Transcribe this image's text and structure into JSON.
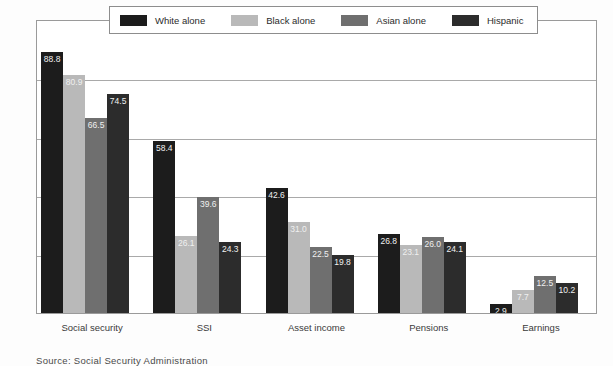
{
  "chart_data": {
    "type": "bar",
    "title": "",
    "subtitle": "",
    "xlabel": "",
    "ylabel": "Percent",
    "ylim": [
      0,
      100
    ],
    "grid": true,
    "gridlines": [
      20,
      40,
      60,
      80
    ],
    "legend_position": "top-center",
    "categories": [
      "Social security",
      "SSI",
      "Asset income",
      "Pensions",
      "Earnings"
    ],
    "series": [
      {
        "name": "White alone",
        "color": "#1c1c1c",
        "values": [
          88.8,
          58.4,
          42.6,
          26.8,
          2.9
        ],
        "labels": [
          "88.8",
          "58.4",
          "42.6",
          "26.8",
          "2.9"
        ]
      },
      {
        "name": "Black alone",
        "color": "#b9b9b9",
        "values": [
          80.9,
          26.1,
          31.0,
          23.1,
          7.7
        ],
        "labels": [
          "80.9",
          "26.1",
          "31.0",
          "23.1",
          "7.7"
        ]
      },
      {
        "name": "Asian alone",
        "color": "#6f6f6f",
        "values": [
          66.5,
          39.6,
          22.5,
          26.0,
          12.5
        ],
        "labels": [
          "66.5",
          "39.6",
          "22.5",
          "26.0",
          "12.5"
        ]
      },
      {
        "name": "Hispanic",
        "color": "#2c2c2c",
        "values": [
          74.5,
          24.3,
          19.8,
          24.1,
          10.2
        ],
        "labels": [
          "74.5",
          "24.3",
          "19.8",
          "24.1",
          "10.2"
        ]
      }
    ]
  },
  "axis": {
    "y_title": "Percent"
  },
  "legend": {
    "entries": [
      {
        "label": "White alone",
        "color": "#1c1c1c"
      },
      {
        "label": "Black alone",
        "color": "#b9b9b9"
      },
      {
        "label": "Asian alone",
        "color": "#6f6f6f"
      },
      {
        "label": "Hispanic",
        "color": "#2c2c2c"
      }
    ]
  },
  "footnote": {
    "text": "Source: Social Security Administration"
  }
}
